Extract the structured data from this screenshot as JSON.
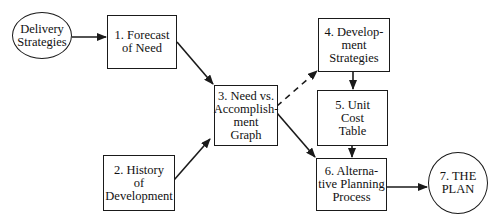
{
  "diagram": {
    "type": "flowchart",
    "nodes": [
      {
        "id": "delivery",
        "shape": "ellipse",
        "label": "Delivery\nStrategies"
      },
      {
        "id": "n1",
        "shape": "box",
        "label": "1. Forecast\nof Need"
      },
      {
        "id": "n2",
        "shape": "box",
        "label": "2. History\nof\nDevelopment"
      },
      {
        "id": "n3",
        "shape": "box",
        "label": "3. Need vs.\nAccomplish-\nment\nGraph"
      },
      {
        "id": "n4",
        "shape": "box",
        "label": "4. Develop-\nment\nStrategies"
      },
      {
        "id": "n5",
        "shape": "box",
        "label": "5. Unit\nCost\nTable"
      },
      {
        "id": "n6",
        "shape": "box",
        "label": "6. Alterna-\ntive Planning\nProcess"
      },
      {
        "id": "n7",
        "shape": "ellipse",
        "label": "7. THE\nPLAN"
      }
    ],
    "edges": [
      {
        "from": "delivery",
        "to": "n1",
        "style": "solid"
      },
      {
        "from": "n1",
        "to": "n3",
        "style": "solid"
      },
      {
        "from": "n2",
        "to": "n3",
        "style": "solid"
      },
      {
        "from": "n3",
        "to": "n4",
        "style": "dashed"
      },
      {
        "from": "n3",
        "to": "n6",
        "style": "solid"
      },
      {
        "from": "n4",
        "to": "n5",
        "style": "solid"
      },
      {
        "from": "n5",
        "to": "n6",
        "style": "solid"
      },
      {
        "from": "n6",
        "to": "n7",
        "style": "solid"
      }
    ],
    "colors": {
      "stroke": "#1a1a1a",
      "background": "#ffffff"
    }
  }
}
